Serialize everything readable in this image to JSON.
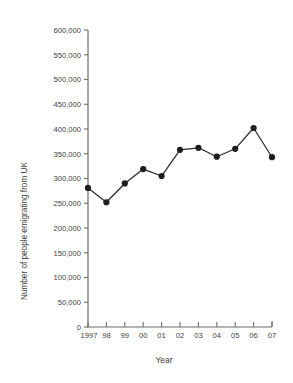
{
  "chart_data": {
    "type": "line",
    "title": "",
    "xlabel": "Year",
    "ylabel": "Number of people emigrating from UK",
    "categories": [
      "1997",
      "98",
      "99",
      "00",
      "01",
      "02",
      "03",
      "04",
      "05",
      "06",
      "07"
    ],
    "x_full_years": [
      1997,
      1998,
      1999,
      2000,
      2001,
      2002,
      2003,
      2004,
      2005,
      2006,
      2007
    ],
    "values": [
      281000,
      252000,
      290000,
      319000,
      305000,
      358000,
      362000,
      344000,
      360000,
      402000,
      343000
    ],
    "series": [
      {
        "name": "Number of people emigrating from UK",
        "values": [
          281000,
          252000,
          290000,
          319000,
          305000,
          358000,
          362000,
          344000,
          360000,
          402000,
          343000
        ]
      }
    ],
    "ylim": [
      0,
      600000
    ],
    "ytick_step": 50000,
    "ytick_labels": [
      "0",
      "50,000",
      "100,000",
      "150,000",
      "200,000",
      "250,000",
      "300,000",
      "350,000",
      "400,000",
      "450,000",
      "500,000",
      "550,000",
      "600,000"
    ],
    "ytick_values": [
      0,
      50000,
      100000,
      150000,
      200000,
      250000,
      300000,
      350000,
      400000,
      450000,
      500000,
      550000,
      600000
    ],
    "grid": false,
    "legend": false,
    "marker": "filled-circle",
    "colors": {
      "line": "#2b2b2b",
      "marker": "#1d1d1d",
      "axis": "#6e6e6e",
      "text": "#3d3d3d",
      "background": "#ffffff"
    }
  }
}
